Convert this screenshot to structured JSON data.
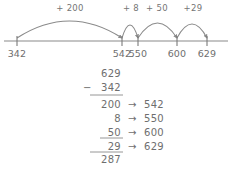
{
  "numberline": {
    "ticks": [
      {
        "label": "342",
        "x": 17
      },
      {
        "label": "542",
        "x": 122
      },
      {
        "label": "550",
        "x": 138
      },
      {
        "label": "600",
        "x": 177
      },
      {
        "label": "629",
        "x": 207
      }
    ],
    "jumps": [
      {
        "label": "+ 200",
        "from": 17,
        "to": 122,
        "label_x": 70,
        "label_y": 11,
        "peak": 17
      },
      {
        "label": "+ 8",
        "from": 122,
        "to": 138,
        "label_x": 131,
        "label_y": 11,
        "peak": 13
      },
      {
        "label": "+ 50",
        "from": 138,
        "to": 177,
        "label_x": 157,
        "label_y": 11,
        "peak": 15
      },
      {
        "label": "+29",
        "from": 177,
        "to": 207,
        "label_x": 193,
        "label_y": 11,
        "peak": 14
      }
    ],
    "axis_y": 41,
    "axis_x1": 4,
    "axis_x2": 228
  },
  "calculation": {
    "minuend": "629",
    "operator": "−",
    "subtrahend": "342",
    "arrow": "→",
    "steps": [
      {
        "addend": "200",
        "running_total": "542"
      },
      {
        "addend": "8",
        "running_total": "550"
      },
      {
        "addend": "50",
        "running_total": "600"
      },
      {
        "addend": "29",
        "running_total": "629"
      }
    ],
    "answer": "287"
  },
  "colors": {
    "ink": "#6e6e6e",
    "line": "#8a8a8a",
    "paper": "#ffffff"
  }
}
